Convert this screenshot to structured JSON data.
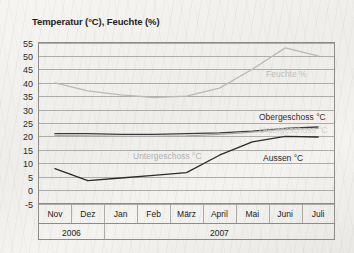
{
  "chart_data": {
    "type": "line",
    "title": "Temperatur (°C), Feuchte (%)",
    "xlabel": "",
    "ylabel": "",
    "ylim": [
      -5,
      55
    ],
    "ytick_step": 5,
    "yticks": [
      "55",
      "50",
      "45",
      "40",
      "35",
      "30",
      "25",
      "20",
      "15",
      "10",
      "5",
      "0",
      "-5"
    ],
    "grid": true,
    "legend_position": "inline-on-plot",
    "categories": [
      "Nov",
      "Dez",
      "Jan",
      "Feb",
      "März",
      "April",
      "Mai",
      "Juni",
      "Juli"
    ],
    "year_groups": [
      {
        "label": "2006",
        "months": [
          "Nov",
          "Dez"
        ]
      },
      {
        "label": "2007",
        "months": [
          "Jan",
          "Feb",
          "März",
          "April",
          "Mai",
          "Juni",
          "Juli"
        ]
      }
    ],
    "series": [
      {
        "name": "Feuchte %",
        "label": "Feuchte %",
        "color": "#b9b9b9",
        "values": [
          40,
          37,
          35.5,
          34.5,
          35,
          38,
          45,
          53,
          50
        ]
      },
      {
        "name": "Obergeschoss °C",
        "label": "Obergeschoss °C",
        "color": "#3a3a3a",
        "values": [
          21,
          21,
          20.8,
          20.8,
          21,
          21.3,
          22,
          23,
          23.5
        ]
      },
      {
        "name": "Untergeschoss °C",
        "label": "Untergeschoss °C",
        "color": "#a9a9a9",
        "values": [
          20.3,
          20.2,
          20,
          20,
          20.2,
          20.8,
          21.6,
          22.6,
          23
        ]
      },
      {
        "name": "Aussen °C",
        "label": "Aussen °C",
        "color": "#2b2b2b",
        "values": [
          8,
          3.5,
          4.5,
          5.5,
          6.5,
          13,
          18,
          20,
          19.8
        ]
      }
    ],
    "inline_labels": [
      {
        "text": "Feuchte %",
        "series": "Feuchte %",
        "x": 266,
        "y": 77,
        "color": "#bdbdbd"
      },
      {
        "text": "Obergeschoss °C",
        "series": "Obergeschoss °C",
        "x": 259,
        "y": 120,
        "color": "#2f2f2f"
      },
      {
        "text": "Untergeschoss °C",
        "series": "Untergeschoss °C",
        "x": 133,
        "y": 159,
        "color": "#b2b2b2"
      },
      {
        "text": "Untergeschoss °C",
        "series": "Untergeschoss °C",
        "x": 259,
        "y": 133,
        "color": "#d3d2cf"
      },
      {
        "text": "Aussen °C",
        "series": "Aussen °C",
        "x": 263,
        "y": 161,
        "color": "#262626"
      }
    ]
  }
}
